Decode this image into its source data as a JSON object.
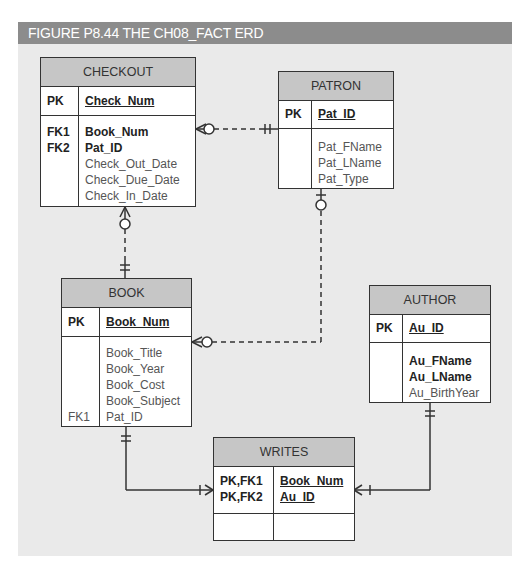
{
  "figure": {
    "title": "FIGURE P8.44  THE CH08_FACT ERD"
  },
  "entities": {
    "checkout": {
      "name": "CHECKOUT",
      "pk": {
        "key": "PK",
        "attr": "Check_Num"
      },
      "keys": [
        "FK1",
        "FK2",
        "",
        "",
        ""
      ],
      "attrs": [
        "Book_Num",
        "Pat_ID",
        "Check_Out_Date",
        "Check_Due_Date",
        "Check_In_Date"
      ]
    },
    "patron": {
      "name": "PATRON",
      "pk": {
        "key": "PK",
        "attr": "Pat_ID"
      },
      "attrs": [
        "Pat_FName",
        "Pat_LName",
        "Pat_Type"
      ]
    },
    "book": {
      "name": "BOOK",
      "pk": {
        "key": "PK",
        "attr": "Book_Num"
      },
      "keys": [
        "",
        "",
        "",
        "",
        "FK1"
      ],
      "attrs": [
        "Book_Title",
        "Book_Year",
        "Book_Cost",
        "Book_Subject",
        "Pat_ID"
      ]
    },
    "author": {
      "name": "AUTHOR",
      "pk": {
        "key": "PK",
        "attr": "Au_ID"
      },
      "attrs": [
        "Au_FName",
        "Au_LName",
        "Au_BirthYear"
      ]
    },
    "writes": {
      "name": "WRITES",
      "pk_keys": [
        "PK,FK1",
        "PK,FK2"
      ],
      "pk_attrs": [
        "Book_Num",
        "Au_ID"
      ]
    }
  },
  "relationships": [
    {
      "from": "CHECKOUT",
      "to": "PATRON",
      "from_card": "zero-or-many",
      "to_card": "one-and-only-one",
      "style": "dashed"
    },
    {
      "from": "CHECKOUT",
      "to": "BOOK",
      "from_card": "zero-or-many",
      "to_card": "one-and-only-one",
      "style": "dashed"
    },
    {
      "from": "BOOK",
      "to": "PATRON",
      "from_card": "zero-or-many",
      "to_card": "zero-or-one",
      "style": "dashed"
    },
    {
      "from": "BOOK",
      "to": "WRITES",
      "from_card": "one-and-only-one",
      "to_card": "one-or-many",
      "style": "solid"
    },
    {
      "from": "AUTHOR",
      "to": "WRITES",
      "from_card": "one-and-only-one",
      "to_card": "one-or-many",
      "style": "solid"
    }
  ]
}
